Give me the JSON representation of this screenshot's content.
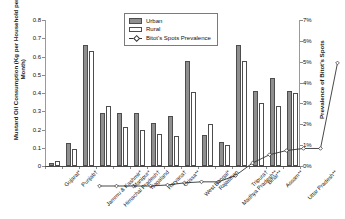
{
  "chart_data": {
    "type": "bar",
    "title": "",
    "xlabel": "",
    "ylabel": "Mustard Oil Consumption (Kg per Household per Month)",
    "y2label": "Prevalence of Bitot's Spots",
    "ylim": [
      0,
      0.8
    ],
    "y2lim": [
      0,
      7
    ],
    "yticks": [
      "0",
      "0.1",
      "0.2",
      "0.3",
      "0.4",
      "0.5",
      "0.6",
      "0.7",
      "0.8"
    ],
    "y2ticks": [
      "0%",
      "1%",
      "2%",
      "3%",
      "4%",
      "5%",
      "6%",
      "7%"
    ],
    "grid": false,
    "legend_position": "top-center",
    "categories": [
      "Gujarat*",
      "Punjab†",
      "Jammu & Kashmir*",
      "Himachal Pradesh†",
      "Manipur*",
      "Nagaland",
      "Haryana†",
      "Orissa**",
      "West Bengal*",
      "Rajasthan",
      "Madhya Pradesh**",
      "Tripura†",
      "Bihar**",
      "Assam**",
      "Uttar Pradesh**"
    ],
    "series": [
      {
        "name": "Urban",
        "axis": "left",
        "type": "bar",
        "color": "#8f8f8f",
        "values": [
          0.015,
          0.128,
          0.665,
          0.288,
          0.288,
          0.288,
          0.235,
          0.275,
          0.575,
          0.172,
          0.132,
          0.662,
          0.412,
          0.482,
          0.412
        ]
      },
      {
        "name": "Rural",
        "axis": "left",
        "type": "bar",
        "color": "#ffffff",
        "values": [
          0.028,
          0.091,
          0.628,
          0.33,
          0.215,
          0.196,
          0.176,
          0.165,
          0.405,
          0.232,
          0.115,
          0.575,
          0.345,
          0.33,
          0.4
        ]
      },
      {
        "name": "Bitot's Spots Prevalence",
        "axis": "right",
        "type": "line",
        "color": "#333333",
        "values": [
          0.0,
          0.0,
          0.0,
          0.0,
          0.05,
          0.15,
          0.2,
          0.2,
          0.5,
          1.1,
          1.5,
          1.7,
          1.8,
          1.8,
          5.9
        ]
      }
    ]
  },
  "legend": {
    "items": [
      {
        "label": "Urban"
      },
      {
        "label": "Rural"
      },
      {
        "label": "Bitot's Spots Prevalence"
      }
    ]
  }
}
